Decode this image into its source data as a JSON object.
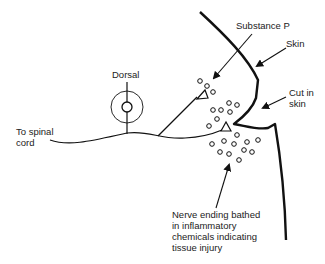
{
  "diagram": {
    "labels": {
      "substance_p": "Substance P",
      "skin": "Skin",
      "dorsal": "Dorsal",
      "cut_in_skin": "Cut in\nskin",
      "to_spinal_cord": "To spinal\ncord",
      "nerve_ending": "Nerve ending bathed\nin inflammatory\nchemicals indicating\ntissue injury"
    },
    "colors": {
      "line": "#111111",
      "text": "#222222",
      "background": "#ffffff"
    }
  }
}
